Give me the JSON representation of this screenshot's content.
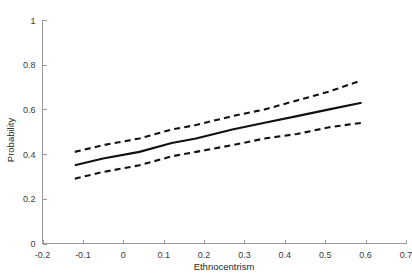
{
  "chart_data": {
    "type": "line",
    "title": "",
    "xlabel": "Ethnocentrism",
    "ylabel": "Probability",
    "xlim": [
      -0.2,
      0.7
    ],
    "ylim": [
      0,
      1
    ],
    "xticks": [
      "-0.2",
      "-0.1",
      "0",
      "0.1",
      "0.2",
      "0.3",
      "0.4",
      "0.5",
      "0.6",
      "0.7"
    ],
    "xtick_values": [
      -0.2,
      -0.1,
      0,
      0.1,
      0.2,
      0.3,
      0.4,
      0.5,
      0.6,
      0.7
    ],
    "yticks": [
      "0",
      "0.2",
      "0.4",
      "0.6",
      "0.8",
      "1"
    ],
    "ytick_values": [
      0,
      0.2,
      0.4,
      0.6,
      0.8,
      1
    ],
    "grid": false,
    "legend": "none",
    "x": [
      -0.12,
      -0.05,
      0.04,
      0.12,
      0.18,
      0.27,
      0.35,
      0.43,
      0.51,
      0.59
    ],
    "series": [
      {
        "name": "Predicted probability",
        "style": "solid",
        "values": [
          0.35,
          0.38,
          0.41,
          0.45,
          0.47,
          0.51,
          0.54,
          0.57,
          0.6,
          0.63
        ]
      },
      {
        "name": "Upper 95% confidence bound",
        "style": "dashed",
        "values": [
          0.41,
          0.44,
          0.47,
          0.51,
          0.53,
          0.57,
          0.6,
          0.64,
          0.68,
          0.73
        ]
      },
      {
        "name": "Lower 95% confidence bound",
        "style": "dashed",
        "values": [
          0.29,
          0.32,
          0.35,
          0.39,
          0.41,
          0.44,
          0.47,
          0.49,
          0.52,
          0.54
        ]
      }
    ]
  }
}
